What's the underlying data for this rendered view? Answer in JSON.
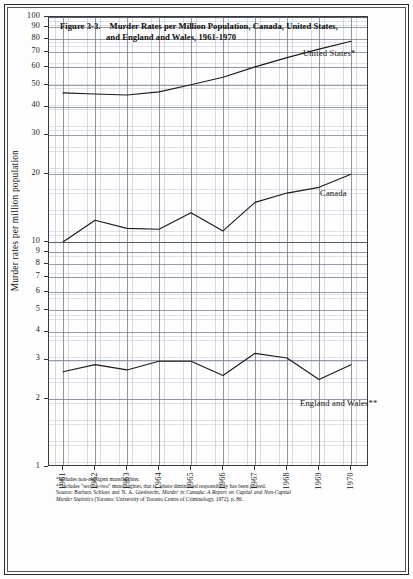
{
  "figure": {
    "number": "Figure 3-3.",
    "title_line1": "Murder Rates per Million Population, Canada, United States,",
    "title_line2": "and England and Wales, 1961-1970",
    "ylabel": "Murder rates per million population"
  },
  "notes": {
    "note1": "*Includes non-negligent manslaughter.",
    "note2": "**Includes \"section-two\" manslaughter, that is, where diminished responsibility has been proved.",
    "source_prefix": "Source: Barbara Schloss and N. A. Giesbrecht, ",
    "source_italic1": "Murder in Canada: A Report on Capital and Non-Capital Murder Statistics",
    "source_mid": " (Toronto: University of Toronto Centre of Criminology, 1972), p. 86."
  },
  "chart_data": {
    "type": "line",
    "xlabel": "",
    "ylabel": "Murder rates per million population",
    "yscale": "log",
    "ylim": [
      1,
      100
    ],
    "grid": true,
    "legend_position": "inline-right",
    "x": [
      1961,
      1962,
      1963,
      1964,
      1965,
      1966,
      1967,
      1968,
      1969,
      1970
    ],
    "categories": [
      "1961",
      "1962",
      "1963",
      "1964",
      "1965",
      "1966",
      "1967",
      "1968",
      "1969",
      "1970"
    ],
    "yticks": [
      1,
      2,
      3,
      4,
      5,
      6,
      7,
      8,
      9,
      10,
      20,
      30,
      40,
      50,
      60,
      70,
      80,
      90,
      100
    ],
    "ytick_labels": [
      "1",
      "2",
      "3",
      "4",
      "5",
      "6",
      "7",
      "8",
      "9",
      "10",
      "20",
      "30",
      "40",
      "50",
      "60",
      "70",
      "80",
      "90",
      "100"
    ],
    "series": [
      {
        "name": "United States*",
        "label": "United States*",
        "values": [
          46.0,
          45.5,
          45.0,
          46.5,
          50.0,
          54.0,
          60.0,
          66.0,
          72.0,
          78.0
        ]
      },
      {
        "name": "Canada",
        "label": "Canada",
        "values": [
          10.0,
          12.5,
          11.5,
          11.4,
          13.5,
          11.2,
          15.0,
          16.5,
          17.5,
          20.0
        ]
      },
      {
        "name": "England and Wales**",
        "label": "England and Wales**",
        "values": [
          2.65,
          2.85,
          2.7,
          2.95,
          2.95,
          2.55,
          3.2,
          3.05,
          2.45,
          2.85
        ]
      }
    ]
  }
}
